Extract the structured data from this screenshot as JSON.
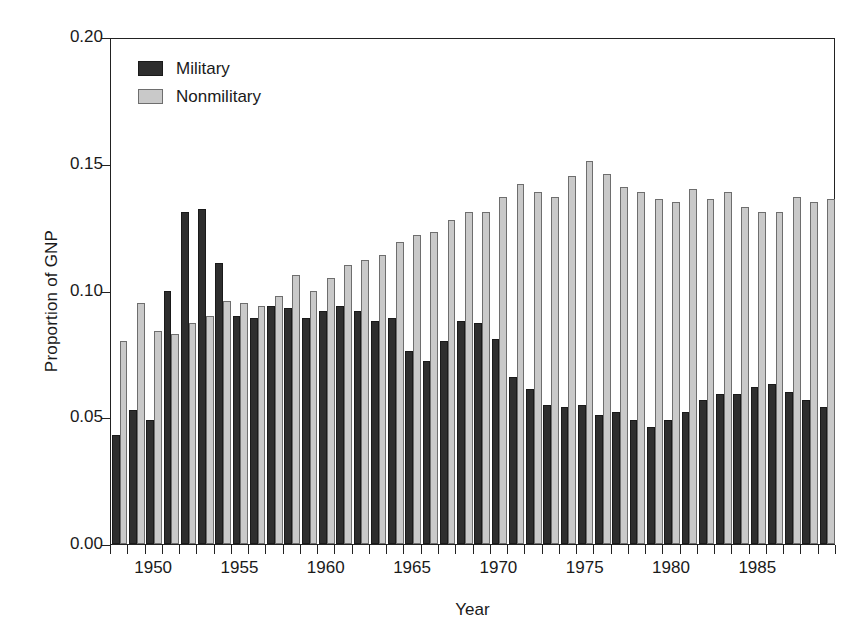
{
  "chart_data": {
    "type": "bar",
    "title": "",
    "xlabel": "Year",
    "ylabel": "Proportion of GNP",
    "ylim": [
      0.0,
      0.2
    ],
    "yticks": [
      "0.00",
      "0.05",
      "0.10",
      "0.15",
      "0.20"
    ],
    "ytick_values": [
      0.0,
      0.05,
      0.1,
      0.15,
      0.2
    ],
    "xlim": [
      1947.5,
      1989.5
    ],
    "xticklabels": [
      "1950",
      "1955",
      "1960",
      "1965",
      "1970",
      "1975",
      "1980",
      "1985"
    ],
    "xtick_values": [
      1950,
      1955,
      1960,
      1965,
      1970,
      1975,
      1980,
      1985
    ],
    "grid": false,
    "legend_position": "upper-left-inside",
    "categories": [
      1948,
      1949,
      1950,
      1951,
      1952,
      1953,
      1954,
      1955,
      1956,
      1957,
      1958,
      1959,
      1960,
      1961,
      1962,
      1963,
      1964,
      1965,
      1966,
      1967,
      1968,
      1969,
      1970,
      1971,
      1972,
      1973,
      1974,
      1975,
      1976,
      1977,
      1978,
      1979,
      1980,
      1981,
      1982,
      1983,
      1984,
      1985,
      1986,
      1987,
      1988,
      1989
    ],
    "series": [
      {
        "name": "Military",
        "color": "#2e2e2e",
        "values": [
          0.043,
          0.053,
          0.049,
          0.1,
          0.131,
          0.132,
          0.111,
          0.09,
          0.089,
          0.094,
          0.093,
          0.089,
          0.092,
          0.094,
          0.092,
          0.088,
          0.089,
          0.076,
          0.072,
          0.08,
          0.088,
          0.087,
          0.081,
          0.066,
          0.061,
          0.055,
          0.054,
          0.055,
          0.051,
          0.052,
          0.049,
          0.046,
          0.049,
          0.052,
          0.057,
          0.059,
          0.059,
          0.062,
          0.063,
          0.06,
          0.057,
          0.054
        ]
      },
      {
        "name": "Nonmilitary",
        "color": "#c9c9c9",
        "values": [
          0.08,
          0.095,
          0.084,
          0.083,
          0.087,
          0.09,
          0.096,
          0.095,
          0.094,
          0.098,
          0.106,
          0.1,
          0.105,
          0.11,
          0.112,
          0.114,
          0.119,
          0.122,
          0.123,
          0.128,
          0.131,
          0.131,
          0.137,
          0.142,
          0.139,
          0.137,
          0.145,
          0.151,
          0.146,
          0.141,
          0.139,
          0.136,
          0.135,
          0.14,
          0.136,
          0.139,
          0.133,
          0.131,
          0.131,
          0.137,
          0.135,
          0.136
        ]
      }
    ]
  },
  "legend": {
    "items": [
      {
        "label": "Military",
        "key": "mil"
      },
      {
        "label": "Nonmilitary",
        "key": "non"
      }
    ]
  }
}
